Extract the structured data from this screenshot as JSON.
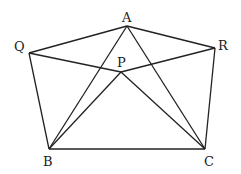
{
  "diagram": {
    "type": "geometry",
    "points": {
      "A": {
        "x": 127,
        "y": 26,
        "label": "A",
        "lx": 122,
        "ly": 22
      },
      "Q": {
        "x": 29,
        "y": 53,
        "label": "Q",
        "lx": 14,
        "ly": 51
      },
      "R": {
        "x": 215,
        "y": 48,
        "label": "R",
        "lx": 218,
        "ly": 50
      },
      "P": {
        "x": 121,
        "y": 72,
        "label": "P",
        "lx": 117,
        "ly": 67
      },
      "B": {
        "x": 49,
        "y": 149,
        "label": "B",
        "lx": 43,
        "ly": 166
      },
      "C": {
        "x": 205,
        "y": 149,
        "label": "C",
        "lx": 204,
        "ly": 166
      }
    },
    "segments": [
      [
        "Q",
        "A"
      ],
      [
        "A",
        "R"
      ],
      [
        "Q",
        "P"
      ],
      [
        "P",
        "R"
      ],
      [
        "Q",
        "B"
      ],
      [
        "R",
        "C"
      ],
      [
        "B",
        "C"
      ],
      [
        "B",
        "A"
      ],
      [
        "A",
        "C"
      ],
      [
        "B",
        "P"
      ],
      [
        "P",
        "C"
      ]
    ]
  }
}
